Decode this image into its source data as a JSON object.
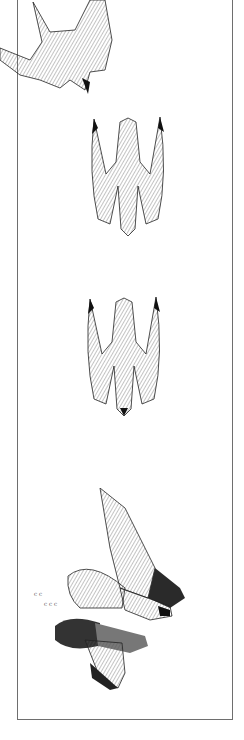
{
  "image": {
    "description": "Pen-and-ink illustration sequence of a peregrine falcon stooping and striking a pigeon, within a thin rectangular frame",
    "figures": [
      {
        "label": "falcon-banking",
        "position": "top"
      },
      {
        "label": "falcon-stoop-1",
        "position": "upper-middle"
      },
      {
        "label": "falcon-stoop-2",
        "position": "lower-middle"
      },
      {
        "label": "falcon-striking-pigeon",
        "position": "bottom"
      }
    ],
    "colors": {
      "ink": "#1a1a1a",
      "frame": "#6e6e6e",
      "background": "#ffffff"
    }
  }
}
